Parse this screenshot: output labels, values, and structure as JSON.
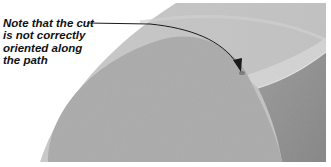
{
  "figure": {
    "annotation": {
      "lines": [
        "Note that the cut",
        "is not correctly",
        "oriented along",
        "the path"
      ]
    },
    "colors": {
      "background": "#ffffff",
      "upper_surface": "#c6c6c6",
      "upper_arc_highlight": "#d2d2d2",
      "disk_face": "#ababab",
      "cut_groove": "#d4d4d4",
      "lower_right_face": "#8e8e8e",
      "callout_text": "#111111",
      "arrow": "#1a1a1a"
    }
  }
}
